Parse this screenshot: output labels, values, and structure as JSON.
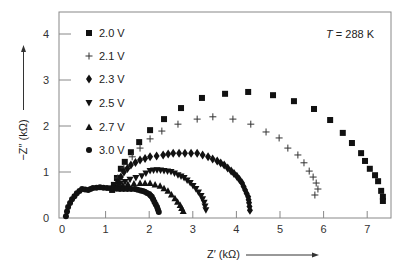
{
  "chart_data": {
    "type": "scatter",
    "title": "",
    "xlabel": "Z′ (kΩ)",
    "ylabel": "−Z″ (kΩ)",
    "xlim": [
      -0.2,
      7.65
    ],
    "ylim": [
      0,
      4.4
    ],
    "xticks": [
      0,
      1,
      2,
      3,
      4,
      5,
      6,
      7
    ],
    "yticks": [
      0,
      1,
      2,
      3,
      4
    ],
    "grid": false,
    "legend_position": "upper-left",
    "annotations": [
      {
        "text": "T = 288 K",
        "position": "upper-right"
      }
    ],
    "series": [
      {
        "name": "2.0 V",
        "marker": "square",
        "x": [
          1.15,
          1.19,
          1.26,
          1.35,
          1.44,
          1.58,
          1.77,
          2.02,
          2.34,
          2.73,
          3.21,
          3.74,
          4.27,
          4.84,
          5.32,
          5.78,
          6.15,
          6.44,
          6.65,
          6.86,
          6.95,
          7.06,
          7.18,
          7.25,
          7.32,
          7.36,
          7.36
        ],
        "y": [
          0.61,
          0.72,
          0.87,
          1.07,
          1.22,
          1.43,
          1.65,
          1.91,
          2.15,
          2.39,
          2.61,
          2.7,
          2.74,
          2.67,
          2.54,
          2.37,
          2.13,
          1.85,
          1.63,
          1.41,
          1.24,
          1.07,
          0.93,
          0.8,
          0.59,
          0.46,
          0.37
        ]
      },
      {
        "name": "2.1 V",
        "marker": "plus",
        "x": [
          1.28,
          1.42,
          1.61,
          1.79,
          2.02,
          2.29,
          2.66,
          3.1,
          3.46,
          3.92,
          4.33,
          4.68,
          4.98,
          5.18,
          5.41,
          5.55,
          5.67,
          5.76,
          5.83,
          5.87,
          5.8
        ],
        "y": [
          0.87,
          1.09,
          1.33,
          1.52,
          1.72,
          1.89,
          2.04,
          2.15,
          2.2,
          2.15,
          2.04,
          1.87,
          1.74,
          1.52,
          1.37,
          1.2,
          1.02,
          0.89,
          0.76,
          0.63,
          0.5
        ]
      },
      {
        "name": "2.3 V",
        "marker": "diamond",
        "x": [
          1.28,
          1.42,
          1.58,
          1.79,
          2.02,
          2.32,
          2.55,
          2.82,
          3.1,
          3.35,
          3.56,
          3.72,
          3.88,
          4.01,
          4.13,
          4.2,
          4.27,
          4.29,
          4.31
        ],
        "y": [
          0.78,
          1.0,
          1.15,
          1.26,
          1.33,
          1.37,
          1.41,
          1.41,
          1.41,
          1.33,
          1.24,
          1.15,
          1.02,
          0.91,
          0.76,
          0.61,
          0.46,
          0.33,
          0.17
        ]
      },
      {
        "name": "2.5 V",
        "marker": "triangle-down",
        "x": [
          1.33,
          1.56,
          1.83,
          2.02,
          2.18,
          2.34,
          2.5,
          2.66,
          2.8,
          2.94,
          3.07,
          3.19,
          3.26,
          3.3
        ],
        "y": [
          0.74,
          0.83,
          0.91,
          1.02,
          1.04,
          1.02,
          1.0,
          0.93,
          0.87,
          0.76,
          0.63,
          0.48,
          0.33,
          0.17
        ]
      },
      {
        "name": "2.7 V",
        "marker": "triangle-up",
        "x": [
          1.28,
          1.51,
          1.79,
          2.02,
          2.25,
          2.43,
          2.59,
          2.71,
          2.78
        ],
        "y": [
          0.7,
          0.74,
          0.76,
          0.76,
          0.7,
          0.59,
          0.43,
          0.28,
          0.15
        ]
      },
      {
        "name": "3.0 V",
        "marker": "circle",
        "x": [
          0.09,
          0.14,
          0.23,
          0.34,
          0.46,
          0.6,
          0.71,
          0.87,
          1.03,
          1.18,
          1.33,
          1.5,
          1.67,
          1.8,
          1.9,
          2.0,
          2.06,
          2.12,
          2.18,
          2.22
        ],
        "y": [
          0.04,
          0.24,
          0.41,
          0.54,
          0.63,
          0.61,
          0.65,
          0.67,
          0.65,
          0.64,
          0.63,
          0.63,
          0.63,
          0.6,
          0.57,
          0.52,
          0.46,
          0.35,
          0.24,
          0.13
        ]
      }
    ]
  },
  "colors": {
    "marker": "#111111",
    "axis": "#666666",
    "text": "#222222"
  }
}
